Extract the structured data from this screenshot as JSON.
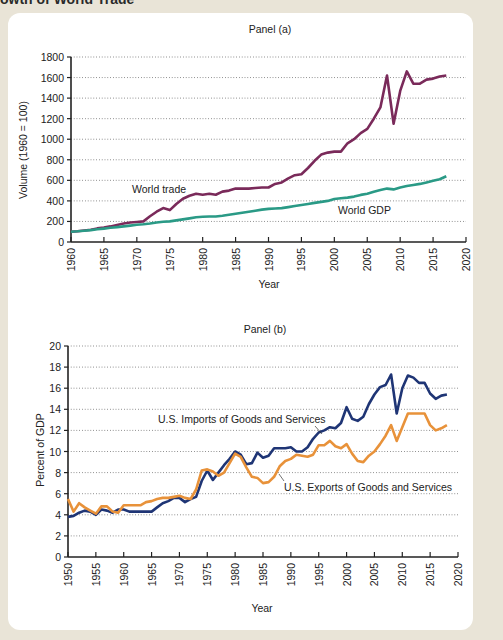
{
  "header": {
    "title_fragment": "owth of World Trade"
  },
  "chart_data": [
    {
      "type": "line",
      "title": "Panel (a)",
      "xlabel": "Year",
      "ylabel": "Volume (1960 = 100)",
      "xlim": [
        1960,
        2020
      ],
      "ylim": [
        0,
        1800
      ],
      "x_ticks": [
        1960,
        1965,
        1970,
        1975,
        1980,
        1985,
        1990,
        1995,
        2000,
        2005,
        2010,
        2015,
        2020
      ],
      "y_ticks": [
        0,
        200,
        400,
        600,
        800,
        1000,
        1200,
        1400,
        1600,
        1800
      ],
      "grid": "horizontal dotted",
      "x": [
        1960,
        1961,
        1962,
        1963,
        1964,
        1965,
        1966,
        1967,
        1968,
        1969,
        1970,
        1971,
        1972,
        1973,
        1974,
        1975,
        1976,
        1977,
        1978,
        1979,
        1980,
        1981,
        1982,
        1983,
        1984,
        1985,
        1986,
        1987,
        1988,
        1989,
        1990,
        1991,
        1992,
        1993,
        1994,
        1995,
        1996,
        1997,
        1998,
        1999,
        2000,
        2001,
        2002,
        2003,
        2004,
        2005,
        2006,
        2007,
        2008,
        2009,
        2010,
        2011,
        2012,
        2013,
        2014,
        2015,
        2016,
        2017
      ],
      "series": [
        {
          "name": "World trade",
          "color": "#7a2a5a",
          "values": [
            100,
            104,
            112,
            120,
            132,
            140,
            152,
            165,
            180,
            190,
            195,
            200,
            250,
            295,
            330,
            310,
            370,
            420,
            450,
            470,
            460,
            470,
            460,
            490,
            500,
            520,
            520,
            520,
            525,
            530,
            530,
            565,
            580,
            620,
            650,
            660,
            720,
            790,
            850,
            870,
            880,
            880,
            960,
            1000,
            1060,
            1100,
            1200,
            1310,
            1620,
            1150,
            1470,
            1660,
            1540,
            1540,
            1580,
            1590,
            1610,
            1620
          ]
        },
        {
          "name": "World GDP",
          "color": "#2a9a86",
          "values": [
            100,
            104,
            110,
            116,
            124,
            130,
            138,
            145,
            152,
            160,
            167,
            172,
            180,
            190,
            198,
            200,
            210,
            220,
            230,
            240,
            245,
            248,
            248,
            256,
            266,
            275,
            285,
            295,
            305,
            315,
            322,
            326,
            330,
            340,
            350,
            360,
            370,
            380,
            390,
            400,
            418,
            425,
            432,
            442,
            458,
            470,
            488,
            505,
            520,
            512,
            530,
            545,
            555,
            565,
            580,
            595,
            610,
            640
          ]
        }
      ],
      "annotations": [
        "World trade",
        "World GDP"
      ]
    },
    {
      "type": "line",
      "title": "Panel (b)",
      "xlabel": "Year",
      "ylabel": "Percent of GDP",
      "xlim": [
        1950,
        2020
      ],
      "ylim": [
        0,
        20
      ],
      "x_ticks": [
        1950,
        1955,
        1960,
        1965,
        1970,
        1975,
        1980,
        1985,
        1990,
        1995,
        2000,
        2005,
        2010,
        2015,
        2020
      ],
      "y_ticks": [
        0,
        2,
        4,
        6,
        8,
        10,
        12,
        14,
        16,
        18,
        20
      ],
      "grid": "horizontal dotted",
      "x": [
        1950,
        1951,
        1952,
        1953,
        1954,
        1955,
        1956,
        1957,
        1958,
        1959,
        1960,
        1961,
        1962,
        1963,
        1964,
        1965,
        1966,
        1967,
        1968,
        1969,
        1970,
        1971,
        1972,
        1973,
        1974,
        1975,
        1976,
        1977,
        1978,
        1979,
        1980,
        1981,
        1982,
        1983,
        1984,
        1985,
        1986,
        1987,
        1988,
        1989,
        1990,
        1991,
        1992,
        1993,
        1994,
        1995,
        1996,
        1997,
        1998,
        1999,
        2000,
        2001,
        2002,
        2003,
        2004,
        2005,
        2006,
        2007,
        2008,
        2009,
        2010,
        2011,
        2012,
        2013,
        2014,
        2015,
        2016,
        2017,
        2018
      ],
      "series": [
        {
          "name": "U.S. Imports of Goods and Services",
          "color": "#1f3575",
          "values": [
            3.8,
            3.9,
            4.2,
            4.4,
            4.3,
            4.0,
            4.5,
            4.4,
            4.2,
            4.5,
            4.5,
            4.3,
            4.3,
            4.3,
            4.3,
            4.3,
            4.7,
            5.1,
            5.3,
            5.6,
            5.6,
            5.2,
            5.5,
            5.7,
            7.2,
            8.2,
            7.3,
            8.0,
            8.7,
            9.3,
            10.0,
            9.7,
            8.8,
            8.9,
            9.9,
            9.4,
            9.6,
            10.3,
            10.3,
            10.3,
            10.4,
            10.0,
            10.0,
            10.4,
            11.2,
            11.8,
            12.0,
            12.3,
            12.2,
            12.7,
            14.2,
            13.1,
            12.9,
            13.3,
            14.5,
            15.4,
            16.1,
            16.3,
            17.3,
            13.6,
            16.0,
            17.2,
            17.0,
            16.5,
            16.5,
            15.5,
            15.0,
            15.3,
            15.4
          ]
        },
        {
          "name": "U.S. Exports of Goods and Services",
          "color": "#e8923a",
          "values": [
            5.5,
            4.3,
            5.1,
            4.7,
            4.4,
            4.1,
            4.8,
            4.8,
            4.3,
            4.2,
            4.9,
            4.9,
            4.9,
            4.9,
            5.2,
            5.3,
            5.5,
            5.6,
            5.6,
            5.7,
            5.8,
            5.6,
            5.5,
            6.4,
            8.2,
            8.3,
            8.1,
            7.7,
            8.0,
            8.9,
            9.8,
            9.5,
            8.5,
            7.6,
            7.5,
            7.0,
            7.1,
            7.6,
            8.6,
            9.1,
            9.3,
            9.7,
            9.6,
            9.5,
            9.7,
            10.6,
            10.6,
            11.0,
            10.5,
            10.3,
            10.7,
            9.8,
            9.1,
            9.0,
            9.6,
            10.0,
            10.7,
            11.5,
            12.5,
            11.0,
            12.3,
            13.6,
            13.6,
            13.6,
            13.6,
            12.5,
            12.0,
            12.2,
            12.5
          ]
        }
      ],
      "annotations": [
        "U.S. Imports of Goods and Services",
        "U.S. Exports of Goods and Services"
      ]
    }
  ]
}
